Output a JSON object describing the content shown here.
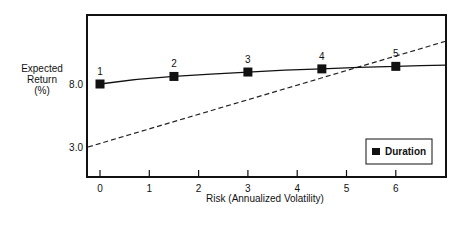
{
  "chart_data": {
    "type": "line",
    "title": "",
    "xlabel": "Risk (Annualized Volatility)",
    "ylabel": [
      "Expected",
      "Return",
      "(%)"
    ],
    "xlim": [
      -0.25,
      7.0
    ],
    "ylim": [
      0.5,
      13.0
    ],
    "x_ticks": [
      0,
      1,
      2,
      3,
      4,
      5,
      6
    ],
    "x_tick_labels": [
      "0",
      "1",
      "2",
      "3",
      "4",
      "5",
      "6"
    ],
    "y_tick_values": [
      8.0,
      3.0
    ],
    "y_tick_labels": [
      "8.0",
      "3.0"
    ],
    "grid": false,
    "legend": {
      "position": "bottom-right",
      "entries": [
        "Duration"
      ]
    },
    "series": [
      {
        "name": "Duration",
        "style": "solid-with-square-markers",
        "color": "#111111",
        "x": [
          0,
          1.5,
          3,
          4.5,
          6
        ],
        "y": [
          8.0,
          8.6,
          8.95,
          9.2,
          9.4
        ],
        "point_labels": [
          "1",
          "2",
          "3",
          "4",
          "5"
        ],
        "extend_to_x": 7.0,
        "extend_y": 9.5
      },
      {
        "name": "Risk-return line",
        "style": "dashed",
        "color": "#222222",
        "x": [
          -0.25,
          7.0
        ],
        "y": [
          3.0,
          11.4
        ]
      }
    ]
  }
}
